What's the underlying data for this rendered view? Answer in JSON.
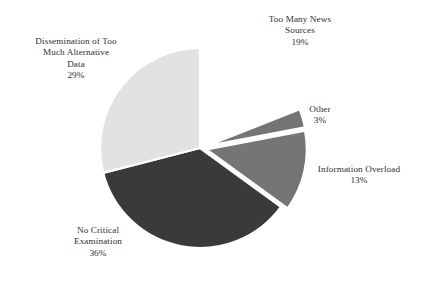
{
  "chart_data": {
    "type": "pie",
    "title": "",
    "subtitle": "",
    "xlabel": "",
    "ylabel": "",
    "legend_position": "none",
    "grid": false,
    "value_unit": "percent",
    "labels_show_percent": true,
    "categories": [
      "Too Many News Sources",
      "Other",
      "Information Overload",
      "No Critical Examination",
      "Dissemination of Too Much Alternative Data"
    ],
    "values": [
      19,
      3,
      13,
      36,
      29
    ],
    "colors": [
      "#ffffff",
      "#757575",
      "#757575",
      "#3a3a3a",
      "#e2e2e2"
    ],
    "slices": [
      {
        "name": "Too Many News Sources",
        "value": 19,
        "percent_text": "19%",
        "color": "#ffffff",
        "exploded": false,
        "start_angle_deg": 0,
        "end_angle_deg": 68.4,
        "label_lines": [
          "Too Many News",
          "Sources"
        ],
        "label_percent": "19%"
      },
      {
        "name": "Other",
        "value": 3,
        "percent_text": "3%",
        "color": "#757575",
        "exploded": true,
        "start_angle_deg": 68.4,
        "end_angle_deg": 79.2,
        "label_lines": [
          "Other"
        ],
        "label_percent": "3%"
      },
      {
        "name": "Information Overload",
        "value": 13,
        "percent_text": "13%",
        "color": "#757575",
        "exploded": true,
        "start_angle_deg": 79.2,
        "end_angle_deg": 126.0,
        "label_lines": [
          "Information Overload"
        ],
        "label_percent": "13%"
      },
      {
        "name": "No Critical Examination",
        "value": 36,
        "percent_text": "36%",
        "color": "#3a3a3a",
        "exploded": false,
        "start_angle_deg": 126.0,
        "end_angle_deg": 255.6,
        "label_lines": [
          "No Critical",
          "Examination"
        ],
        "label_percent": "36%"
      },
      {
        "name": "Dissemination of Too Much Alternative Data",
        "value": 29,
        "percent_text": "29%",
        "color": "#e2e2e2",
        "exploded": false,
        "start_angle_deg": 255.6,
        "end_angle_deg": 360,
        "label_lines": [
          "Dissemination of Too",
          "Much Alternative",
          "Data"
        ],
        "label_percent": "29%"
      }
    ],
    "geometry": {
      "center_x": 200,
      "center_y": 148,
      "radius": 100,
      "separator_color": "#ffffff",
      "separator_width": 2.2
    }
  },
  "labels": {
    "news": {
      "line1": "Too Many News",
      "line2": "Sources",
      "percent": "19%"
    },
    "dissemination": {
      "line1": "Dissemination of Too",
      "line2": "Much Alternative",
      "line3": "Data",
      "percent": "29%"
    },
    "other": {
      "line1": "Other",
      "percent": "3%"
    },
    "information_overload": {
      "line1": "Information Overload",
      "percent": "13%"
    },
    "no_critical": {
      "line1": "No Critical",
      "line2": "Examination",
      "percent": "36%"
    }
  }
}
